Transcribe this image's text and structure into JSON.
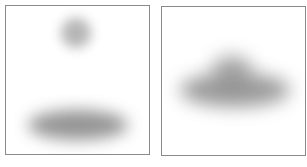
{
  "panels": [
    {
      "id": "left",
      "blobs": [
        "small-round-blob-top",
        "wide-elongated-blob-bottom"
      ],
      "blob_color": "#7a7a7a"
    },
    {
      "id": "right",
      "blobs": [
        "cloud-shaped-blob-center"
      ],
      "blob_color": "#7a7a7a"
    }
  ],
  "frame_color": "#8a8a8a",
  "background": "#ffffff"
}
